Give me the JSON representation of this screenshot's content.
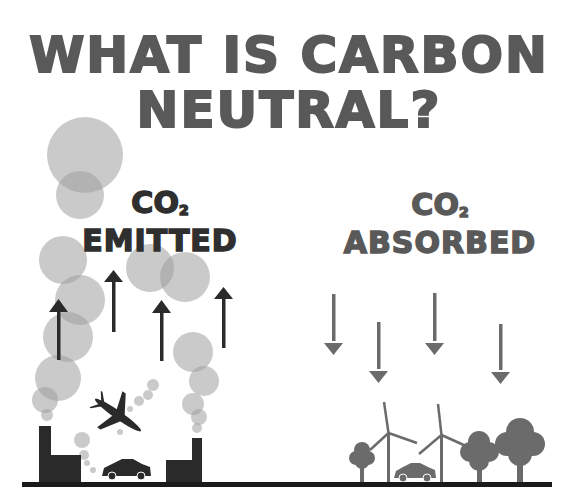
{
  "title": {
    "line1": "WHAT IS CARBON",
    "line2": "NEUTRAL?"
  },
  "left_panel": {
    "co2_label": "CO",
    "co2_subscript": "2",
    "caption": "EMITTED",
    "arrow_direction": "up",
    "arrow_count": 5,
    "sources": [
      "factory-chimney",
      "airplane",
      "car",
      "factory-chimney"
    ]
  },
  "right_panel": {
    "co2_label": "CO",
    "co2_subscript": "2",
    "caption": "ABSORBED",
    "arrow_direction": "down",
    "arrow_count": 5,
    "absorbers": [
      "tree",
      "wind-turbine",
      "car",
      "wind-turbine",
      "tree",
      "tree"
    ]
  },
  "colors": {
    "title": "#595959",
    "emitted_text": "#2f2f2f",
    "absorbed_text": "#595959",
    "smoke": "#bdbdbd",
    "dark_elements": "#2a2a2a",
    "green_elements": "#6b6b6b",
    "ground": "#1a1a1a"
  }
}
